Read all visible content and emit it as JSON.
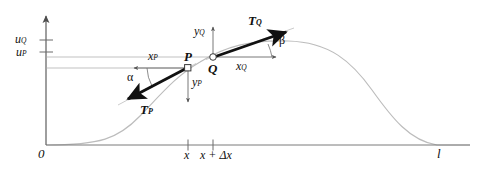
{
  "figure": {
    "type": "physics-diagram",
    "colors": {
      "curve": "#b9b9b9",
      "axis": "#6f6f6f",
      "vector": "#111111",
      "thin_guide": "#909090",
      "text": "#101010",
      "background": "#ffffff"
    }
  },
  "axes": {
    "vertical": {
      "name": "u-axis",
      "x_px": 46,
      "top_px": 13,
      "bottom_px": 145
    },
    "horizontal": {
      "name": "x-axis",
      "y_px": 145,
      "left_px": 46,
      "right_px": 470
    },
    "origin_label": "0",
    "right_end_label": "l",
    "y_ticks": [
      {
        "label_main": "u",
        "label_sub": "Q",
        "y_px": 40
      },
      {
        "label_main": "u",
        "label_sub": "P",
        "y_px": 52
      }
    ],
    "x_ticks": [
      {
        "label": "x",
        "x_px": 188
      },
      {
        "label": "x + Δx",
        "x_px": 213
      }
    ]
  },
  "points": [
    {
      "name": "P",
      "label": "P",
      "x_px": 188,
      "y_px": 68
    },
    {
      "name": "Q",
      "label": "Q",
      "x_px": 213,
      "y_px": 57
    }
  ],
  "vectors": [
    {
      "name": "T_P",
      "label_main": "T",
      "label_sub": "P",
      "from": [
        188,
        68
      ],
      "to": [
        127,
        100
      ],
      "label_pos": [
        143,
        108
      ],
      "description": "tension at P pointing down-left along the tangent"
    },
    {
      "name": "T_Q",
      "label_main": "T",
      "label_sub": "Q",
      "from": [
        213,
        57
      ],
      "to": [
        287,
        31
      ],
      "label_pos": [
        251,
        20
      ],
      "description": "tension at Q pointing up-right along the tangent"
    }
  ],
  "components": [
    {
      "name": "x_P",
      "label_main": "x",
      "label_sub": "P",
      "from": [
        188,
        68
      ],
      "to": [
        133,
        68
      ],
      "label_pos": [
        152,
        54
      ],
      "orientation": "left"
    },
    {
      "name": "y_P",
      "label_main": "y",
      "label_sub": "P",
      "from": [
        188,
        68
      ],
      "to": [
        188,
        103
      ],
      "label_pos": [
        193,
        80
      ],
      "orientation": "down"
    },
    {
      "name": "x_Q",
      "label_main": "x",
      "label_sub": "Q",
      "from": [
        213,
        57
      ],
      "to": [
        277,
        57
      ],
      "label_pos": [
        239,
        63
      ],
      "orientation": "right"
    },
    {
      "name": "y_Q",
      "label_main": "y",
      "label_sub": "Q",
      "from": [
        213,
        57
      ],
      "to": [
        213,
        26
      ],
      "label_pos": [
        196,
        28
      ],
      "orientation": "up"
    }
  ],
  "angles": [
    {
      "name": "alpha",
      "label": "α",
      "glyph": "α",
      "at_point": "P",
      "vertex": [
        188,
        68
      ],
      "label_pos": [
        129,
        76
      ],
      "between": [
        "x_P",
        "T_P"
      ]
    },
    {
      "name": "beta",
      "label": "β",
      "glyph": "β",
      "at_point": "Q",
      "vertex": [
        213,
        57
      ],
      "label_pos": [
        281,
        40
      ],
      "between": [
        "x_Q",
        "T_Q"
      ]
    }
  ],
  "curve": {
    "name": "string-displacement-curve",
    "path": "M 46 145 C 100 145 118 139 140 116 C 163 92 176 76 200 62 C 226 46 250 40 288 41 C 330 42 352 62 372 90 C 392 118 410 141 437 145 L 470 145",
    "note": "hump-shaped displacement profile of the string between 0 and l"
  }
}
